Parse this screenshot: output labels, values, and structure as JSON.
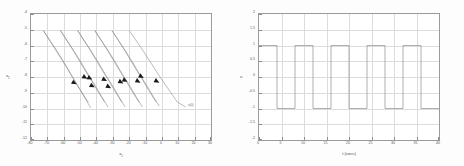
{
  "figure": {
    "background": "#fdfdfd",
    "axis_color": "#9a9a9a",
    "grid_color": "#dcdcdc",
    "line_color": "#8c8c8c",
    "arrow_color": "#1a1a1a"
  },
  "chart_data": [
    {
      "type": "line",
      "name": "phase-plane-trajectories",
      "title": "",
      "xlabel": "x1",
      "xlabel_base": "x",
      "xlabel_sub": "1",
      "ylabel": "x2",
      "ylabel_base": "x",
      "ylabel_sub": "2",
      "xlim": [
        -80,
        30
      ],
      "ylim": [
        -12,
        -4
      ],
      "xticks": [
        -80,
        -70,
        -60,
        -50,
        -40,
        -30,
        -20,
        -10,
        0,
        10,
        20,
        30
      ],
      "yticks": [
        -4,
        -5,
        -6,
        -7,
        -8,
        -9,
        -10,
        -11,
        -12
      ],
      "xtick_labels": [
        "-80",
        "-70",
        "-60",
        "-50",
        "-40",
        "-30",
        "-20",
        "-10",
        "0",
        "10",
        "20",
        "30"
      ],
      "ytick_labels": [
        "-4",
        "-5",
        "-6",
        "-7",
        "-8",
        "-9",
        "-10",
        "-11",
        "-12"
      ],
      "grid": true,
      "legend": "none",
      "annotation": "x(0)",
      "annotation_x": 16,
      "annotation_y": -9.85,
      "series": [
        {
          "name": "traj-1",
          "points": [
            [
              -72.5,
              -5.05
            ],
            [
              -66.0,
              -6.05
            ],
            [
              -60.5,
              -6.95
            ],
            [
              -56.0,
              -7.75
            ],
            [
              -52.0,
              -8.45
            ],
            [
              -47.0,
              -9.35
            ],
            [
              -43.5,
              -9.95
            ]
          ]
        },
        {
          "name": "traj-2",
          "points": [
            [
              -72.5,
              -5.05
            ],
            [
              -64.5,
              -6.35
            ],
            [
              -58.5,
              -7.35
            ],
            [
              -54.5,
              -8.05
            ],
            [
              -50.0,
              -8.8
            ],
            [
              -45.0,
              -9.6
            ]
          ]
        },
        {
          "name": "traj-3",
          "points": [
            [
              -62.0,
              -5.05
            ],
            [
              -55.0,
              -6.15
            ],
            [
              -49.5,
              -7.05
            ],
            [
              -45.0,
              -7.85
            ],
            [
              -41.0,
              -8.5
            ],
            [
              -36.5,
              -9.3
            ],
            [
              -33.0,
              -9.9
            ]
          ]
        },
        {
          "name": "traj-4",
          "points": [
            [
              -62.0,
              -5.05
            ],
            [
              -54.0,
              -6.35
            ],
            [
              -48.0,
              -7.4
            ],
            [
              -43.5,
              -8.15
            ],
            [
              -39.5,
              -8.85
            ],
            [
              -35.0,
              -9.6
            ]
          ]
        },
        {
          "name": "traj-5",
          "points": [
            [
              -51.5,
              -5.05
            ],
            [
              -44.5,
              -6.15
            ],
            [
              -39.0,
              -7.05
            ],
            [
              -34.5,
              -7.85
            ],
            [
              -30.5,
              -8.5
            ],
            [
              -26.0,
              -9.3
            ],
            [
              -22.5,
              -9.9
            ]
          ]
        },
        {
          "name": "traj-6",
          "points": [
            [
              -51.5,
              -5.05
            ],
            [
              -43.5,
              -6.35
            ],
            [
              -37.5,
              -7.4
            ],
            [
              -33.0,
              -8.15
            ],
            [
              -29.0,
              -8.85
            ],
            [
              -24.5,
              -9.6
            ]
          ]
        },
        {
          "name": "traj-7",
          "points": [
            [
              -41.0,
              -5.05
            ],
            [
              -34.0,
              -6.15
            ],
            [
              -28.5,
              -7.05
            ],
            [
              -24.0,
              -7.85
            ],
            [
              -20.0,
              -8.5
            ],
            [
              -15.5,
              -9.3
            ],
            [
              -12.0,
              -9.9
            ]
          ]
        },
        {
          "name": "traj-8",
          "points": [
            [
              -41.0,
              -5.05
            ],
            [
              -33.0,
              -6.35
            ],
            [
              -27.0,
              -7.4
            ],
            [
              -22.5,
              -8.15
            ],
            [
              -18.5,
              -8.85
            ],
            [
              -14.0,
              -9.6
            ]
          ]
        },
        {
          "name": "traj-9",
          "points": [
            [
              -30.5,
              -5.05
            ],
            [
              -23.5,
              -6.15
            ],
            [
              -18.0,
              -7.05
            ],
            [
              -13.5,
              -7.85
            ],
            [
              -9.5,
              -8.5
            ],
            [
              -5.0,
              -9.3
            ],
            [
              -1.5,
              -9.85
            ]
          ]
        },
        {
          "name": "traj-10",
          "points": [
            [
              -30.5,
              -5.05
            ],
            [
              -22.5,
              -6.35
            ],
            [
              -16.5,
              -7.4
            ],
            [
              -12.0,
              -8.15
            ],
            [
              -8.0,
              -8.85
            ],
            [
              -3.5,
              -9.6
            ]
          ]
        },
        {
          "name": "traj-11",
          "points": [
            [
              -20.0,
              -5.05
            ],
            [
              -12.0,
              -6.25
            ],
            [
              -5.5,
              -7.3
            ],
            [
              -0.5,
              -8.1
            ],
            [
              4.5,
              -8.85
            ],
            [
              9.5,
              -9.6
            ],
            [
              14.5,
              -9.9
            ]
          ]
        }
      ],
      "arrows": [
        {
          "x": -54.0,
          "y": -8.35,
          "angle": 28
        },
        {
          "x": -47.5,
          "y": -8.0,
          "angle": 28
        },
        {
          "x": -44.5,
          "y": -8.05,
          "angle": 28
        },
        {
          "x": -43.0,
          "y": -8.55,
          "angle": 28
        },
        {
          "x": -35.5,
          "y": -8.15,
          "angle": 28
        },
        {
          "x": -33.0,
          "y": -8.6,
          "angle": 28
        },
        {
          "x": -25.5,
          "y": -8.3,
          "angle": 28
        },
        {
          "x": -23.0,
          "y": -8.2,
          "angle": 28
        },
        {
          "x": -15.0,
          "y": -8.25,
          "angle": 28
        },
        {
          "x": -13.0,
          "y": -7.95,
          "angle": 28
        },
        {
          "x": -3.5,
          "y": -8.25,
          "angle": 28
        }
      ]
    },
    {
      "type": "line",
      "name": "square-wave-control",
      "title": "",
      "xlabel": "t (secs)",
      "ylabel": "u",
      "xlim": [
        0,
        40
      ],
      "ylim": [
        -2,
        2
      ],
      "xticks": [
        0,
        5,
        10,
        15,
        20,
        25,
        30,
        35,
        40
      ],
      "yticks": [
        -2,
        -1.5,
        -1,
        -0.5,
        0,
        0.5,
        1,
        1.5,
        2
      ],
      "xtick_labels": [
        "0",
        "5",
        "10",
        "15",
        "20",
        "25",
        "30",
        "35",
        "40"
      ],
      "ytick_labels": [
        "-2",
        "-1.5",
        "-1",
        "-0.5",
        "0",
        "0.5",
        "1",
        "1.5",
        "2"
      ],
      "grid": true,
      "legend": "none",
      "amplitude": 1,
      "period": 8,
      "duty_cycle": 0.5,
      "waveform": [
        [
          0,
          1
        ],
        [
          4,
          1
        ],
        [
          4,
          -1
        ],
        [
          8,
          -1
        ],
        [
          8,
          1
        ],
        [
          12,
          1
        ],
        [
          12,
          -1
        ],
        [
          16,
          -1
        ],
        [
          16,
          1
        ],
        [
          20,
          1
        ],
        [
          20,
          -1
        ],
        [
          24,
          -1
        ],
        [
          24,
          1
        ],
        [
          28,
          1
        ],
        [
          28,
          -1
        ],
        [
          32,
          -1
        ],
        [
          32,
          1
        ],
        [
          36,
          1
        ],
        [
          36,
          -1
        ],
        [
          40,
          -1
        ]
      ]
    }
  ]
}
